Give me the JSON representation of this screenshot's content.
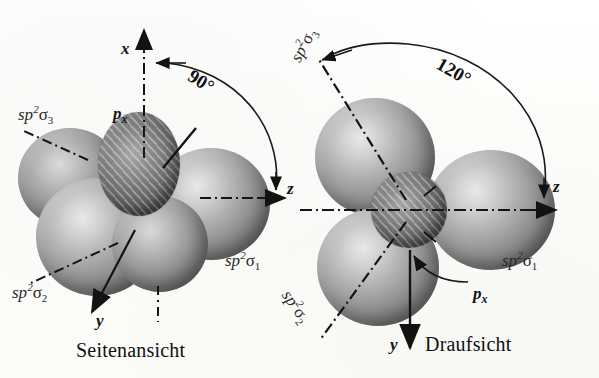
{
  "figure": {
    "background_color": "#fdfdfb",
    "ink_color": "#1a1a1a"
  },
  "panels": [
    {
      "id": "side-view",
      "caption": "Seitenansicht",
      "angle_annotation": "90°",
      "axes": [
        {
          "name": "x-axis",
          "label": "x"
        },
        {
          "name": "y-axis",
          "label": "y"
        },
        {
          "name": "z-axis",
          "label": "z"
        }
      ],
      "orbitals": [
        {
          "name": "sp2-sigma-1",
          "base": "sp",
          "sup": "2",
          "sigma": "σ",
          "sub": "1"
        },
        {
          "name": "sp2-sigma-2",
          "base": "sp",
          "sup": "2",
          "sigma": "σ",
          "sub": "2"
        },
        {
          "name": "sp2-sigma-3",
          "base": "sp",
          "sup": "2",
          "sigma": "σ",
          "sub": "3"
        }
      ],
      "p_orbital": {
        "base": "p",
        "sub": "x"
      }
    },
    {
      "id": "top-view",
      "caption": "Draufsicht",
      "angle_annotation": "120°",
      "axes": [
        {
          "name": "y-axis",
          "label": "y"
        },
        {
          "name": "z-axis",
          "label": "z"
        }
      ],
      "orbitals": [
        {
          "name": "sp2-sigma-1",
          "base": "sp",
          "sup": "2",
          "sigma": "σ",
          "sub": "1"
        },
        {
          "name": "sp2-sigma-2",
          "base": "sp",
          "sup": "2",
          "sigma": "σ",
          "sub": "2"
        },
        {
          "name": "sp2-sigma-3",
          "base": "sp",
          "sup": "2",
          "sigma": "σ",
          "sub": "3"
        }
      ],
      "p_orbital": {
        "base": "p",
        "sub": "x"
      }
    }
  ],
  "labels": {
    "left_sp3": "sp",
    "left_sp3_sup": "2",
    "left_sp3_sig": "σ",
    "left_sp3_sub": "3",
    "left_sp2": "sp",
    "left_sp2_sup": "2",
    "left_sp2_sig": "σ",
    "left_sp2_sub": "2",
    "left_sp1": "sp",
    "left_sp1_sup": "2",
    "left_sp1_sig": "σ",
    "left_sp1_sub": "1",
    "left_px": "p",
    "left_px_sub": "x",
    "left_x_axis": "x",
    "left_y_axis": "y",
    "left_z_axis": "z",
    "left_angle": "90°",
    "left_caption": "Seitenansicht",
    "right_sp3": "sp",
    "right_sp3_sup": "2",
    "right_sp3_sig": "σ",
    "right_sp3_sub": "3",
    "right_sp2": "sp",
    "right_sp2_sup": "2",
    "right_sp2_sig": "σ",
    "right_sp2_sub": "2",
    "right_sp1": "sp",
    "right_sp1_sup": "2",
    "right_sp1_sig": "σ",
    "right_sp1_sub": "1",
    "right_px": "p",
    "right_px_sub": "x",
    "right_y_axis": "y",
    "right_z_axis": "z",
    "right_angle": "120°",
    "right_caption": "Draufsicht"
  }
}
